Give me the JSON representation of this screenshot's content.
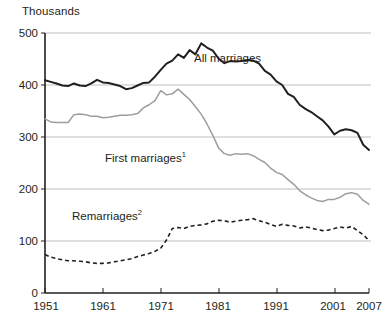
{
  "chart_data": {
    "type": "line",
    "title": "",
    "unit_label": "Thousands",
    "xlabel": "",
    "ylabel": "Thousands",
    "ylim": [
      0,
      500
    ],
    "xlim": [
      1951,
      2007
    ],
    "yticks": [
      0,
      100,
      200,
      300,
      400,
      500
    ],
    "ytick_labels": [
      "0",
      "100",
      "200",
      "300",
      "400",
      "500"
    ],
    "xticks": [
      1951,
      1961,
      1971,
      1981,
      1991,
      2001,
      2007
    ],
    "xtick_labels": [
      "1951",
      "1961",
      "1971",
      "1981",
      "1991",
      "2001",
      "2007"
    ],
    "grid": "horizontal",
    "legend_position": "inline-annotations",
    "x": [
      1951,
      1952,
      1953,
      1954,
      1955,
      1956,
      1957,
      1958,
      1959,
      1960,
      1961,
      1962,
      1963,
      1964,
      1965,
      1966,
      1967,
      1968,
      1969,
      1970,
      1971,
      1972,
      1973,
      1974,
      1975,
      1976,
      1977,
      1978,
      1979,
      1980,
      1981,
      1982,
      1983,
      1984,
      1985,
      1986,
      1987,
      1988,
      1989,
      1990,
      1991,
      1992,
      1993,
      1994,
      1995,
      1996,
      1997,
      1998,
      1999,
      2000,
      2001,
      2002,
      2003,
      2004,
      2005,
      2006,
      2007
    ],
    "series": [
      {
        "name": "All marriages",
        "style": "solid",
        "color": "#231f20",
        "values": [
          409,
          406,
          403,
          399,
          398,
          403,
          399,
          398,
          403,
          410,
          405,
          404,
          401,
          398,
          392,
          394,
          399,
          404,
          405,
          416,
          429,
          441,
          447,
          459,
          452,
          467,
          459,
          480,
          472,
          466,
          451,
          442,
          446,
          445,
          446,
          448,
          447,
          441,
          427,
          420,
          407,
          400,
          383,
          377,
          362,
          354,
          348,
          340,
          332,
          320,
          305,
          312,
          315,
          313,
          308,
          285,
          275
        ]
      },
      {
        "name": "First marriages",
        "footnote": "1",
        "style": "solid",
        "color": "#9d9d9d",
        "values": [
          335,
          329,
          328,
          328,
          328,
          343,
          344,
          343,
          340,
          340,
          337,
          338,
          340,
          342,
          342,
          343,
          345,
          356,
          362,
          370,
          389,
          381,
          383,
          392,
          382,
          372,
          358,
          344,
          325,
          303,
          279,
          268,
          265,
          268,
          267,
          268,
          264,
          257,
          251,
          240,
          232,
          228,
          218,
          209,
          197,
          189,
          183,
          178,
          176,
          180,
          180,
          184,
          191,
          193,
          190,
          178,
          171
        ]
      },
      {
        "name": "Remarriages",
        "footnote": "2",
        "style": "dashed",
        "color": "#231f20",
        "values": [
          74,
          69,
          66,
          64,
          62,
          62,
          61,
          60,
          58,
          57,
          57,
          58,
          60,
          62,
          64,
          66,
          70,
          73,
          76,
          80,
          86,
          102,
          124,
          126,
          124,
          128,
          130,
          131,
          133,
          138,
          140,
          139,
          136,
          138,
          140,
          141,
          143,
          139,
          136,
          132,
          128,
          132,
          130,
          129,
          125,
          127,
          125,
          122,
          120,
          121,
          124,
          127,
          125,
          128,
          120,
          112,
          101
        ]
      }
    ],
    "annotations": [
      {
        "text": "All marriages",
        "x_px": 194,
        "y_px": 58
      },
      {
        "text": "First marriages",
        "footnote": "1",
        "x_px": 105,
        "y_px": 158
      },
      {
        "text": "Remarriages",
        "footnote": "2",
        "x_px": 72,
        "y_px": 216
      }
    ]
  }
}
